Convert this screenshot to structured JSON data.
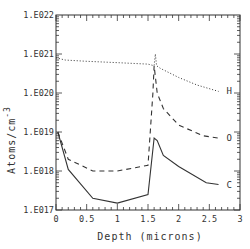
{
  "chart_data": {
    "type": "line",
    "title": "",
    "xlabel": "Depth (microns)",
    "ylabel": "Atoms/cm^-3",
    "ylabel_text": "Atoms/cm",
    "ylabel_sup": "-3",
    "xlim": [
      0,
      3
    ],
    "ylim": [
      1e+17,
      1e+22
    ],
    "yscale": "log",
    "grid": false,
    "legend_position": "inline right end of each curve",
    "x_ticks": [
      "0",
      "0.5",
      "1",
      "1.5",
      "2",
      "2.5",
      "3"
    ],
    "y_ticks": [
      "1.E017",
      "1.E018",
      "1.E019",
      "1.E020",
      "1.E021",
      "1.E022"
    ],
    "series": [
      {
        "name": "H",
        "style": "dotted",
        "x": [
          0.0,
          0.15,
          0.5,
          1.0,
          1.5,
          1.6,
          1.62,
          1.64,
          1.7,
          2.0,
          2.3,
          2.65
        ],
        "values": [
          8e+20,
          7e+20,
          6.5e+20,
          6e+20,
          5.5e+20,
          5e+20,
          1e+21,
          5e+20,
          4.3e+20,
          2.5e+20,
          1.6e+20,
          1.1e+20
        ]
      },
      {
        "name": "O",
        "style": "dashed",
        "x": [
          0.03,
          0.2,
          0.6,
          1.0,
          1.5,
          1.58,
          1.6,
          1.65,
          1.75,
          2.0,
          2.4,
          2.65
        ],
        "values": [
          1e+19,
          2e+18,
          1e+18,
          1e+18,
          1.4e+18,
          1e+20,
          5e+20,
          1e+20,
          4e+19,
          1.5e+19,
          8e+18,
          7e+18
        ]
      },
      {
        "name": "C",
        "style": "solid",
        "x": [
          0.03,
          0.2,
          0.6,
          1.0,
          1.5,
          1.6,
          1.65,
          1.75,
          2.0,
          2.45,
          2.65
        ],
        "values": [
          1e+19,
          1.1e+18,
          2e+17,
          1.5e+17,
          2.5e+17,
          7e+18,
          6e+18,
          2.5e+18,
          1.3e+18,
          5e+17,
          4.5e+17
        ]
      }
    ]
  },
  "labels": {
    "H": "H",
    "O": "O",
    "C": "C"
  }
}
